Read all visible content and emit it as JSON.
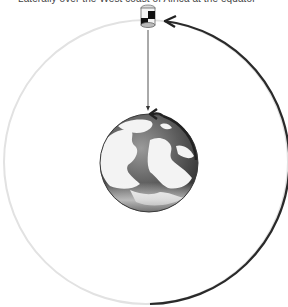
{
  "caption": "Laterally over the West coast of Africa at the equator",
  "diagram": {
    "elements": [
      {
        "name": "satellite",
        "icon": "satellite-icon"
      },
      {
        "name": "orbit",
        "description": "circular orbit path, dark arc with arrow indicating direction of motion"
      },
      {
        "name": "earth",
        "icon": "globe-icon",
        "description": "Earth with rotation arrow"
      },
      {
        "name": "signal-line",
        "description": "line from satellite to Earth"
      }
    ],
    "colors": {
      "orbit_light": "#e0e0e0",
      "orbit_dark": "#2a2a2a",
      "earth_ocean": "#5a5a5a",
      "earth_land": "#f2f2f2"
    }
  }
}
